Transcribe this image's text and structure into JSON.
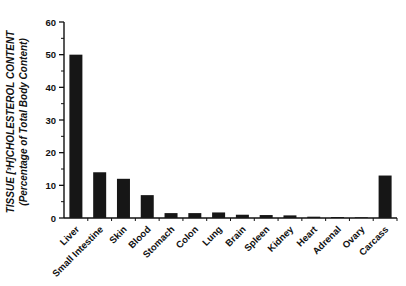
{
  "colors": {
    "background": "#ffffff",
    "bar": "#161616",
    "axis": "#111111",
    "text": "#111111"
  },
  "y_axis": {
    "title_line1": "TISSUE [³H]CHOLESTEROL CONTENT",
    "title_line2": "(Percentage of Total Body Content)"
  },
  "chart_data": {
    "type": "bar",
    "title": "",
    "xlabel": "",
    "ylabel": "TISSUE [³H]CHOLESTEROL CONTENT (Percentage of Total Body Content)",
    "categories": [
      "Liver",
      "Small Intestine",
      "Skin",
      "Blood",
      "Stomach",
      "Colon",
      "Lung",
      "Brain",
      "Spleen",
      "Kidney",
      "Heart",
      "Adrenal",
      "Ovary",
      "Carcass"
    ],
    "values": [
      50,
      14,
      12,
      7,
      1.5,
      1.5,
      1.7,
      1.0,
      0.9,
      0.8,
      0.4,
      0.3,
      0.2,
      13
    ],
    "ylim": [
      0,
      60
    ],
    "ytick_major": [
      0,
      10,
      20,
      30,
      40,
      50,
      60
    ],
    "ytick_minor_step": 5,
    "grid": false,
    "legend_position": "none",
    "bar_color": "#161616",
    "x_tick_style": "between-categories",
    "x_label_rotation_deg": -45
  }
}
